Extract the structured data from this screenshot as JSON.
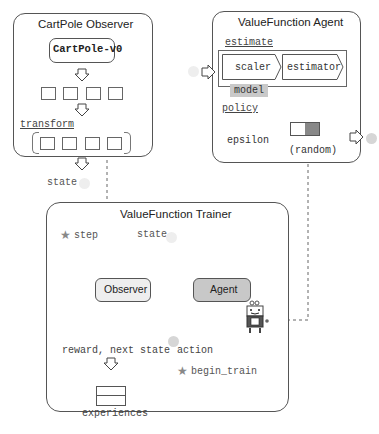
{
  "observer": {
    "title": "CartPole Observer",
    "env_label": "CartPole-v0",
    "transform_label": "transform",
    "output_label": "state"
  },
  "agent": {
    "title": "ValueFunction Agent",
    "estimate_label": "estimate",
    "scaler_label": "scaler",
    "estimator_label": "estimator",
    "model_label": "model",
    "policy_label": "policy",
    "epsilon_label": "epsilon",
    "random_label": "(random)"
  },
  "trainer": {
    "title": "ValueFunction Trainer",
    "step_label": "step",
    "state_label": "state",
    "observer_label": "Observer",
    "agent_label": "Agent",
    "reward_label": "reward, next state",
    "action_label": "action",
    "begin_train_label": "begin_train",
    "experiences_label": "experiences"
  },
  "colors": {
    "agent_fill": "#c8c8c8",
    "model_fill": "#bdbdbd",
    "dot": "#d6d6d6",
    "star": "#999999",
    "policy_selected": "#888888"
  }
}
